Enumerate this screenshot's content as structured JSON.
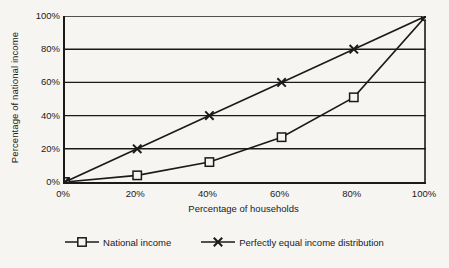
{
  "chart_data": {
    "type": "line",
    "title": "",
    "xlabel": "Percentage of households",
    "ylabel": "Percentage of national income",
    "xlim": [
      0,
      100
    ],
    "ylim": [
      0,
      100
    ],
    "grid": "horizontal",
    "legend_position": "bottom",
    "x": [
      0,
      20,
      40,
      60,
      80,
      100
    ],
    "xticklabels": [
      "0%",
      "20%",
      "40%",
      "60%",
      "80%",
      "100%"
    ],
    "yticks": [
      0,
      20,
      40,
      60,
      80,
      100
    ],
    "yticklabels": [
      "0%",
      "20%",
      "40%",
      "60%",
      "80%",
      "100%"
    ],
    "series": [
      {
        "name": "National income",
        "marker": "square",
        "values": [
          0,
          4,
          12,
          27,
          51,
          100
        ]
      },
      {
        "name": "Perfectly equal income distribution",
        "marker": "x-cross",
        "values": [
          0,
          20,
          40,
          60,
          80,
          100
        ]
      }
    ],
    "colors": {
      "line": "#1a1a1a",
      "axis": "#1a1a1a",
      "grid": "#1a1a1a",
      "background": "#f6f5f2"
    }
  },
  "legend": {
    "entries": [
      {
        "label": "National income",
        "marker": "square-marker-icon"
      },
      {
        "label": "Perfectly equal income distribution",
        "marker": "x-cross-marker-icon"
      }
    ]
  }
}
